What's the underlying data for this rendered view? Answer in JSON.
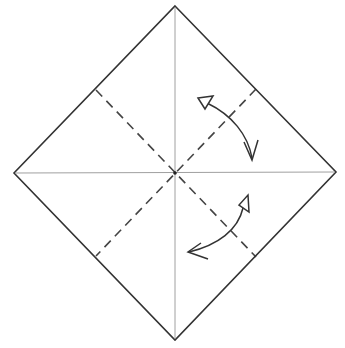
{
  "diagram": {
    "title": "Origami base: square on point with valley-fold preview",
    "colors": {
      "background": "#ffffff",
      "outline": "#333333",
      "crease": "#9a9a9a",
      "dashed": "#444444",
      "arrow": "#333333"
    },
    "square": {
      "top": [
        175,
        6
      ],
      "right": [
        336,
        172
      ],
      "bottom": [
        175,
        340
      ],
      "left": [
        14,
        173
      ]
    },
    "center": [
      175,
      173
    ],
    "creases": [
      {
        "name": "vertical-crease",
        "from": [
          175,
          6
        ],
        "to": [
          175,
          340
        ],
        "style": "thin"
      },
      {
        "name": "horizontal-crease",
        "from": [
          14,
          173
        ],
        "to": [
          336,
          172
        ],
        "style": "thin"
      }
    ],
    "valley_folds": [
      {
        "name": "valley-fold-nw-se",
        "from": [
          96,
          90
        ],
        "to": [
          256,
          257
        ]
      },
      {
        "name": "valley-fold-ne-sw",
        "from": [
          256,
          89
        ],
        "to": [
          96,
          256
        ]
      }
    ],
    "arrows": [
      {
        "name": "fold-unfold-arrow-upper-right",
        "description": "fold and unfold arrow, hollow head top-left, open head bottom"
      },
      {
        "name": "fold-unfold-arrow-lower-right",
        "description": "fold and unfold arrow, hollow head top-right, open head bottom-left"
      }
    ]
  }
}
